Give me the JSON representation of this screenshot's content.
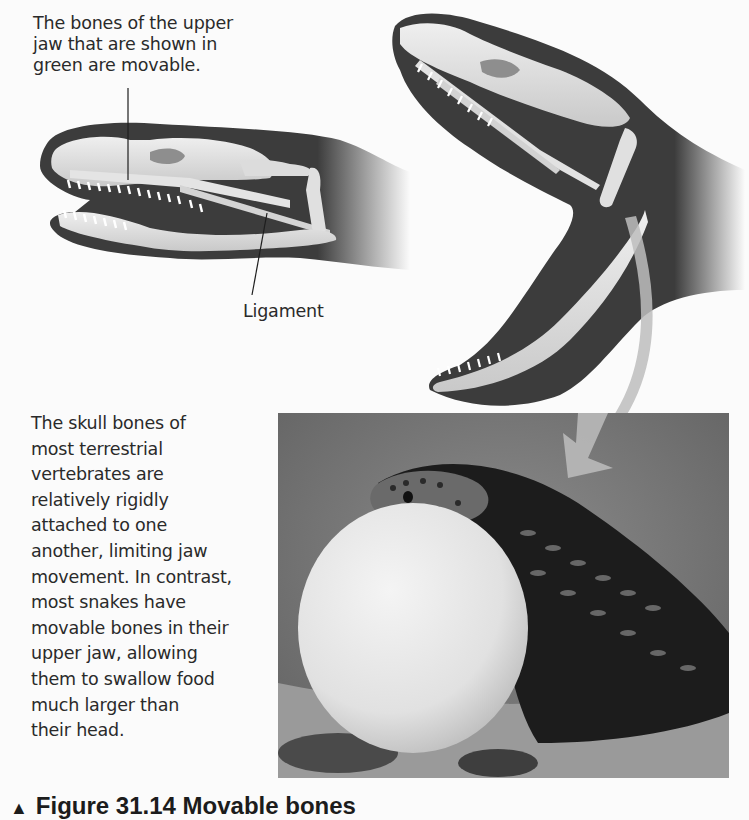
{
  "figure": {
    "top_annotation": "The bones of the upper jaw that are shown in green are movable.",
    "top_annotation_lines": [
      "The bones of the upper",
      "jaw that are shown in",
      "green are movable."
    ],
    "ligament_label": "Ligament",
    "body_text_lines": [
      "The skull bones of",
      "most terrestrial",
      "vertebrates are",
      "relatively rigidly",
      "attached to one",
      "another, limiting jaw",
      "movement. In contrast,",
      "most snakes have",
      "movable bones in their",
      "upper jaw, allowing",
      "them to swallow food",
      "much larger than",
      "their head."
    ],
    "caption": {
      "marker": "▲",
      "text": "Figure 31.14 Movable bones"
    },
    "illustrations": {
      "closed_jaw": "snake-skull-closed-jaw",
      "open_jaw": "snake-skull-open-jaw",
      "photo": "snake-swallowing-egg-photo",
      "arrow": "curved-arrow-to-photo"
    },
    "colors": {
      "head_silhouette": "#3c3c3c",
      "bone": "#d9d9d9",
      "bone_highlight": "#eeeeee",
      "arrow": "#bdbdbd",
      "photo_bg": "#7a7a7a",
      "egg": "#e6e6e6"
    }
  }
}
